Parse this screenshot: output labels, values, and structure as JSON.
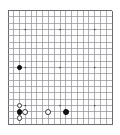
{
  "app": {
    "title": "Go Board",
    "board_label": "goban"
  },
  "board": {
    "size": 19,
    "columns": 19,
    "rows": 19,
    "grid_color": "#8e8e94",
    "edge_color": "#6b6b71",
    "background_color": "#fdfdfd",
    "star_point_color": "#4a4a50",
    "black_stone_color": "#151518",
    "white_stone_color": "#fbfbfb",
    "star_points": [
      {
        "col": 3,
        "row": 3
      },
      {
        "col": 9,
        "row": 3
      },
      {
        "col": 15,
        "row": 3
      },
      {
        "col": 3,
        "row": 9
      },
      {
        "col": 9,
        "row": 9
      },
      {
        "col": 15,
        "row": 9
      },
      {
        "col": 3,
        "row": 15
      },
      {
        "col": 9,
        "row": 15
      },
      {
        "col": 15,
        "row": 15
      }
    ],
    "stones": [
      {
        "col": 2,
        "row": 9,
        "color": "black",
        "label": "black-stone-1"
      },
      {
        "col": 2,
        "row": 15,
        "color": "white",
        "label": "white-stone-1"
      },
      {
        "col": 2,
        "row": 16,
        "color": "black",
        "label": "black-stone-2"
      },
      {
        "col": 3,
        "row": 16,
        "color": "white",
        "label": "white-stone-2"
      },
      {
        "col": 2,
        "row": 17,
        "color": "white",
        "label": "white-stone-3"
      },
      {
        "col": 7,
        "row": 16,
        "color": "white",
        "label": "white-stone-4"
      },
      {
        "col": 10,
        "row": 16,
        "color": "black",
        "label": "black-stone-3"
      }
    ]
  }
}
